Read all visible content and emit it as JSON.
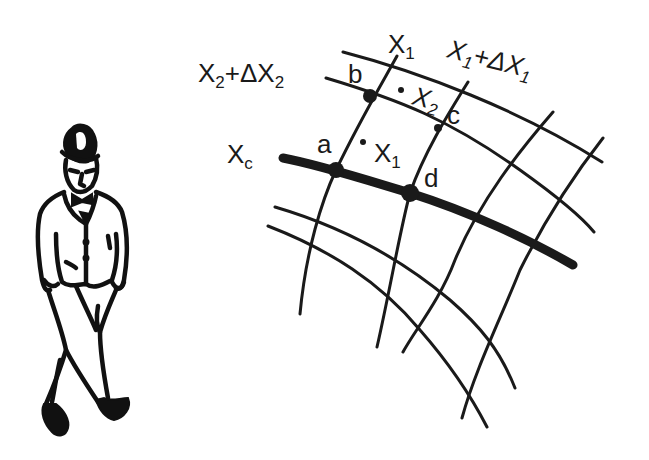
{
  "figure": {
    "observer": "walking-man-in-hat"
  },
  "labels": {
    "x1": {
      "base": "X",
      "sub": "1"
    },
    "x1_plus": {
      "base": "X",
      "sub": "1",
      "rest": "+ΔX",
      "sub2": "1"
    },
    "x2_plus": {
      "base": "X",
      "sub": "2",
      "rest": "+ΔX",
      "sub2": "2"
    },
    "xc": {
      "base": "X",
      "sub": "c"
    },
    "point_a": "a",
    "point_b": "b",
    "point_c": "c",
    "point_d": "d",
    "cell_x1": {
      "base": "X",
      "sub": "1"
    },
    "cell_x2": {
      "base": "X",
      "sub": "2"
    }
  },
  "colors": {
    "ink": "#1a1a1a",
    "background": "#ffffff"
  }
}
